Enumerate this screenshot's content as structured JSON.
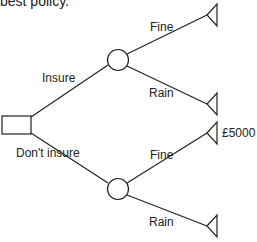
{
  "title": "best policy.",
  "diagram": {
    "type": "decision-tree",
    "decision_node": {
      "label": ""
    },
    "branches": [
      {
        "label": "Insure",
        "outcomes": [
          {
            "label": "Fine",
            "value": ""
          },
          {
            "label": "Rain",
            "value": ""
          }
        ]
      },
      {
        "label": "Don't insure",
        "outcomes": [
          {
            "label": "Fine",
            "value": "£5000"
          },
          {
            "label": "Rain",
            "value": ""
          }
        ]
      }
    ]
  },
  "colors": {
    "line": "#222222",
    "background": "#ffffff"
  }
}
